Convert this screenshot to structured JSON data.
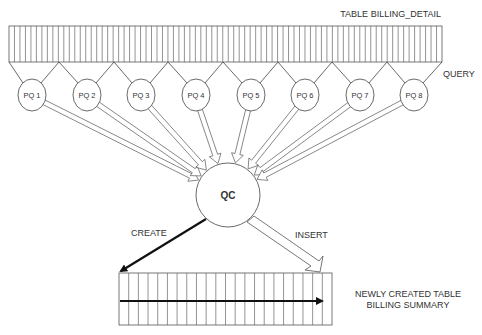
{
  "diagram": {
    "source_table": {
      "label": "TABLE BILLING_DETAIL"
    },
    "query_label": "QUERY",
    "parallel_query_servers": [
      {
        "label": "PQ 1"
      },
      {
        "label": "PQ 2"
      },
      {
        "label": "PQ 3"
      },
      {
        "label": "PQ 4"
      },
      {
        "label": "PQ 5"
      },
      {
        "label": "PQ 6"
      },
      {
        "label": "PQ 7"
      },
      {
        "label": "PQ 8"
      }
    ],
    "coordinator": {
      "label": "QC"
    },
    "create_label": "CREATE",
    "insert_label": "INSERT",
    "target_table": {
      "label_line1": "NEWLY CREATED TABLE",
      "label_line2": "BILLING SUMMARY"
    },
    "colors": {
      "stroke": "#555555",
      "thick": "#111111",
      "text": "#333333"
    }
  }
}
